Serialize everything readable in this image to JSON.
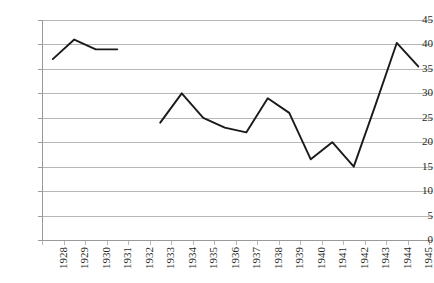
{
  "chart_data": {
    "type": "line",
    "title": "",
    "subtitle": "",
    "xlabel": "",
    "ylabel": "",
    "categories": [
      "1928",
      "1929",
      "1930",
      "1931",
      "1932",
      "1933",
      "1934",
      "1935",
      "1936",
      "1937",
      "1938",
      "1939",
      "1940",
      "1941",
      "1942",
      "1943",
      "1944",
      "1945"
    ],
    "values": [
      37,
      41,
      39,
      39,
      null,
      24,
      30,
      25,
      23,
      22,
      29,
      26,
      16.5,
      20,
      15,
      27.5,
      40.3,
      35.5
    ],
    "series": [
      {
        "name": "",
        "values": [
          37,
          41,
          39,
          39,
          null,
          24,
          30,
          25,
          23,
          22,
          29,
          26,
          16.5,
          20,
          15,
          27.5,
          40.3,
          35.5
        ]
      }
    ],
    "ylim": [
      0,
      45
    ],
    "yticks": [
      0,
      5,
      10,
      15,
      20,
      25,
      30,
      35,
      40,
      45
    ],
    "ytick_labels": [
      "0",
      "5",
      "10",
      "15",
      "20",
      "25",
      "30",
      "35",
      "40",
      "45"
    ],
    "xtick_labels": [
      "1928",
      "1929",
      "1930",
      "1931",
      "1932",
      "1933",
      "1934",
      "1935",
      "1936",
      "1937",
      "1938",
      "1939",
      "1940",
      "1941",
      "1942",
      "1943",
      "1944",
      "1945"
    ],
    "grid": "horizontal",
    "legend": "none",
    "line_color": "#1a1a1a",
    "grid_color": "#b7b7b7",
    "axis_color": "#9a9a9a",
    "text_color": "#231f20",
    "gap_categories": [
      "1932"
    ],
    "annotations": []
  }
}
